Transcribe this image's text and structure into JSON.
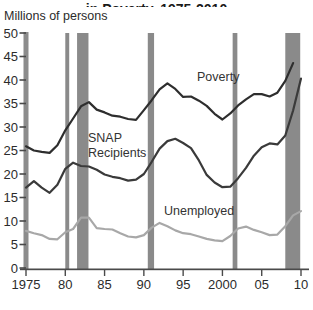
{
  "header": {
    "clipped_title": "in Poverty, 1975-2010",
    "note": "title is cut off at top edge of screenshot"
  },
  "chart_data": {
    "type": "line",
    "title": "in Poverty, 1975-2010",
    "ylabel": "Millions of persons",
    "xlabel": "",
    "xlim": [
      1975,
      2010
    ],
    "ylim": [
      0,
      50
    ],
    "grid": false,
    "legend_position": "inline-annotations",
    "yticks": [
      0,
      5,
      10,
      15,
      20,
      25,
      30,
      35,
      40,
      45,
      50
    ],
    "xticks": [
      {
        "year": 1975,
        "label": "1975"
      },
      {
        "year": 1980,
        "label": "80"
      },
      {
        "year": 1985,
        "label": "85"
      },
      {
        "year": 1990,
        "label": "90"
      },
      {
        "year": 1995,
        "label": "95"
      },
      {
        "year": 2000,
        "label": "2000"
      },
      {
        "year": 2005,
        "label": "05"
      },
      {
        "year": 2010,
        "label": "10"
      }
    ],
    "series": [
      {
        "name": "Poverty",
        "color": "#2e2e2e",
        "start_year": 1975,
        "values": [
          25.9,
          25.0,
          24.7,
          24.5,
          26.1,
          29.3,
          31.8,
          34.4,
          35.3,
          33.7,
          33.1,
          32.4,
          32.2,
          31.7,
          31.5,
          33.6,
          35.7,
          38.0,
          39.3,
          38.1,
          36.4,
          36.5,
          35.6,
          34.5,
          32.8,
          31.6,
          32.9,
          34.6,
          35.9,
          37.0,
          37.0,
          36.5,
          37.3,
          39.8,
          43.6
        ]
      },
      {
        "name": "SNAP Recipients",
        "color": "#3a3a3a",
        "start_year": 1975,
        "values": [
          17.1,
          18.5,
          17.1,
          16.0,
          17.7,
          21.1,
          22.4,
          21.7,
          21.6,
          20.9,
          19.9,
          19.4,
          19.1,
          18.6,
          18.8,
          20.0,
          22.6,
          25.4,
          27.0,
          27.5,
          26.6,
          25.5,
          22.9,
          19.8,
          18.2,
          17.2,
          17.3,
          19.1,
          21.3,
          23.9,
          25.7,
          26.5,
          26.3,
          28.2,
          33.5,
          40.3
        ]
      },
      {
        "name": "Unemployed",
        "color": "#a8a8a8",
        "start_year": 1975,
        "values": [
          7.9,
          7.4,
          7.0,
          6.2,
          6.1,
          7.6,
          8.3,
          10.7,
          10.7,
          8.5,
          8.3,
          8.2,
          7.4,
          6.7,
          6.5,
          7.0,
          8.6,
          9.6,
          8.9,
          8.0,
          7.4,
          7.2,
          6.7,
          6.2,
          5.9,
          5.7,
          6.8,
          8.4,
          8.8,
          8.1,
          7.6,
          7.0,
          7.1,
          8.9,
          11.2,
          12.1
        ]
      }
    ],
    "recession_bands": [
      {
        "from": 1980.0,
        "to": 1980.5
      },
      {
        "from": 1981.5,
        "to": 1982.95
      },
      {
        "from": 1990.5,
        "to": 1991.3
      },
      {
        "from": 2001.3,
        "to": 2001.9
      },
      {
        "from": 2008.0,
        "to": 2009.9
      }
    ],
    "colors": {
      "recession_band": "#8a8a8a",
      "y_axis_bar": "#8c8c8c",
      "axis_line": "#4a4a4a",
      "tick": "#4a4a4a",
      "tick_label": "#2b2b2b"
    }
  }
}
